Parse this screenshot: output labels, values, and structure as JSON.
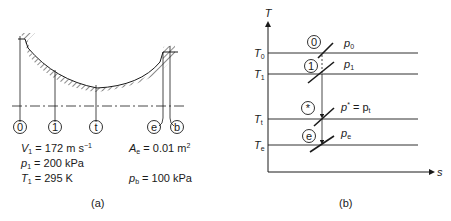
{
  "panel_a": {
    "caption": "(a)",
    "stations": [
      "0",
      "1",
      "t",
      "e",
      "b"
    ],
    "given": {
      "V1": {
        "sym": "V",
        "sub": "1",
        "eq": " = 172 m s",
        "sup": "−1"
      },
      "p1": {
        "sym": "p",
        "sub": "1",
        "eq": " = 200 kPa"
      },
      "T1": {
        "sym": "T",
        "sub": "1",
        "eq": " = 295 K"
      },
      "Ae": {
        "sym": "A",
        "sub": "e",
        "eq": " = 0.01 m",
        "sup": "2"
      },
      "pb": {
        "sym": "p",
        "sub": "b",
        "eq": " = 100 kPa"
      }
    }
  },
  "panel_b": {
    "caption": "(b)",
    "y_axis": "T",
    "x_axis": "s",
    "temperature_levels": [
      {
        "sym": "T",
        "sub": "0"
      },
      {
        "sym": "T",
        "sub": "1"
      },
      {
        "sym": "T",
        "sub": "t"
      },
      {
        "sym": "T",
        "sub": "e"
      }
    ],
    "states": [
      "0",
      "1",
      "*",
      "e"
    ],
    "isobars": {
      "p0": {
        "sym": "p",
        "sub": "0"
      },
      "p1": {
        "sym": "p",
        "sub": "1"
      },
      "pstar": {
        "sym": "p",
        "sup": "*",
        "eq": " = p",
        "sub2": "t"
      },
      "pe": {
        "sym": "p",
        "sub": "e"
      }
    }
  }
}
